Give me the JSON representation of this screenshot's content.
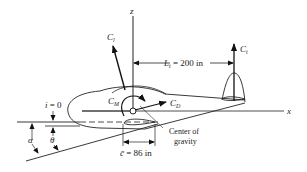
{
  "diagram": {
    "axes": {
      "z_label": "z",
      "x_label": "x"
    },
    "forces": {
      "lift_wing": {
        "symbol": "C",
        "subscript": "l"
      },
      "lift_tail": {
        "symbol": "C",
        "subscript": "t"
      },
      "drag": {
        "symbol": "C",
        "subscript": "D"
      },
      "moment": {
        "symbol": "C",
        "subscript": "M"
      }
    },
    "dimensions": {
      "tail_arm": {
        "symbol": "L",
        "subscript": "t",
        "value": " = 200 in"
      },
      "mean_chord": {
        "symbol": "c̄",
        "value": " = 86 in"
      }
    },
    "angles": {
      "incidence": {
        "symbol": "i",
        "value": " = 0"
      },
      "alpha": "α",
      "theta": "θ"
    },
    "annotations": {
      "center_of_gravity_line1": "Center of",
      "center_of_gravity_line2": "gravity"
    }
  }
}
